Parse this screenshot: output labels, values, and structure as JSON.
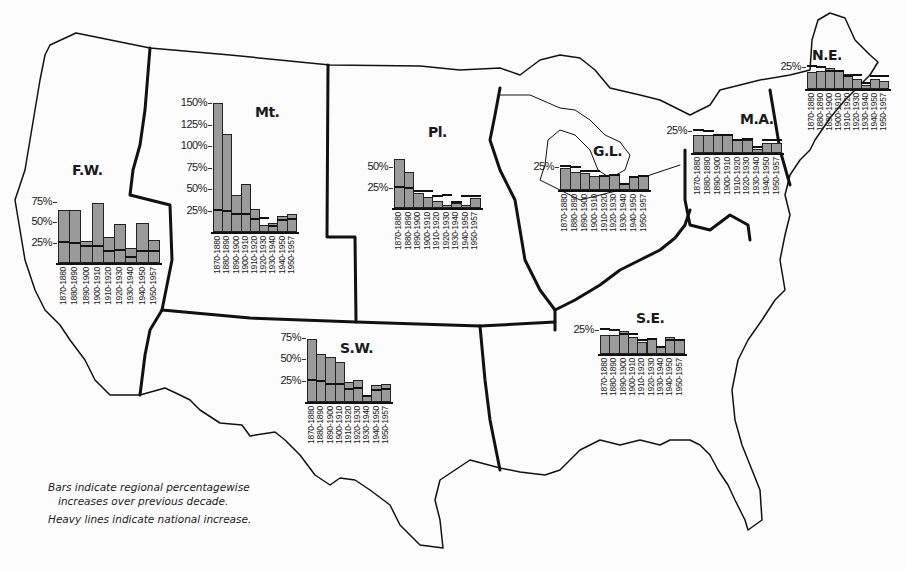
{
  "legend": {
    "line1": "Bars indicate regional percentagewise",
    "line2": "increases over previous decade.",
    "line3": "Heavy lines indicate national increase."
  },
  "decades": [
    "1870-1880",
    "1880-1890",
    "1890-1900",
    "1900-1910",
    "1910-1920",
    "1920-1930",
    "1930-1940",
    "1940-1950",
    "1950-1957"
  ],
  "national": [
    26,
    25,
    21,
    21,
    15,
    16,
    7,
    14.5,
    15
  ],
  "regions": [
    {
      "id": "fw",
      "label": "F.W.",
      "ticks": [
        "75%",
        "50%",
        "25%"
      ]
    },
    {
      "id": "mt",
      "label": "Mt.",
      "ticks": [
        "150%",
        "125%",
        "100%",
        "75%",
        "50%",
        "25%"
      ]
    },
    {
      "id": "pl",
      "label": "Pl.",
      "ticks": [
        "50%",
        "25%"
      ]
    },
    {
      "id": "gl",
      "label": "G.L.",
      "ticks": [
        "25%"
      ]
    },
    {
      "id": "ma",
      "label": "M.A.",
      "ticks": [
        "25%"
      ]
    },
    {
      "id": "ne",
      "label": "N.E.",
      "ticks": [
        "25%"
      ]
    },
    {
      "id": "sw",
      "label": "S.W.",
      "ticks": [
        "75%",
        "50%",
        "25%"
      ]
    },
    {
      "id": "se",
      "label": "S.E.",
      "ticks": [
        "25%"
      ]
    }
  ],
  "chart_data": {
    "type": "bar",
    "categories": [
      "1870-1880",
      "1880-1890",
      "1890-1900",
      "1900-1910",
      "1910-1920",
      "1920-1930",
      "1930-1940",
      "1940-1950",
      "1950-1957"
    ],
    "xlabel": "Decade",
    "ylabel": "Percent increase",
    "annotations": [
      "Bars indicate regional percentagewise increases over previous decade.",
      "Heavy lines indicate national increase."
    ],
    "series": [
      {
        "name": "National (heavy line)",
        "values": [
          26,
          25,
          21,
          21,
          15,
          16,
          7,
          14.5,
          15
        ]
      },
      {
        "name": "F.W.",
        "values": [
          65,
          65,
          27,
          73,
          32,
          47,
          18,
          49,
          28
        ]
      },
      {
        "name": "Mt.",
        "values": [
          150,
          114,
          43,
          56,
          27,
          8,
          11,
          19,
          21
        ]
      },
      {
        "name": "Pl.",
        "values": [
          60,
          44,
          18,
          14,
          9,
          4,
          6,
          4,
          12
        ]
      },
      {
        "name": "G.L.",
        "values": [
          24,
          20,
          19,
          15,
          16,
          17,
          7,
          15,
          16
        ]
      },
      {
        "name": "M.A.",
        "values": [
          20,
          21,
          21,
          22,
          16,
          15,
          5,
          11,
          11
        ]
      },
      {
        "name": "N.E.",
        "values": [
          19,
          20,
          24,
          22,
          17,
          11,
          5,
          11,
          9
        ]
      },
      {
        "name": "S.W.",
        "values": [
          73,
          56,
          52,
          46,
          23,
          26,
          8,
          20,
          21
        ]
      },
      {
        "name": "S.E.",
        "values": [
          20,
          20,
          24,
          18,
          13,
          16,
          8,
          18,
          15
        ]
      }
    ]
  }
}
